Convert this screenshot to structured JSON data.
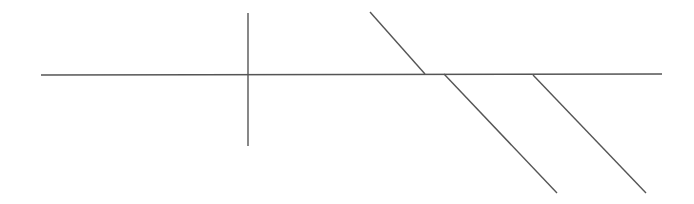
{
  "diagram": {
    "width": 694,
    "height": 204,
    "background": "#ffffff",
    "stroke_color": "#555555",
    "stroke_width": 1.4,
    "lines": [
      {
        "name": "horizontal-line",
        "x1": 41,
        "y1": 75,
        "x2": 662,
        "y2": 74
      },
      {
        "name": "vertical-line",
        "x1": 248,
        "y1": 13,
        "x2": 248,
        "y2": 146
      },
      {
        "name": "diagonal-line-upper",
        "x1": 370,
        "y1": 12,
        "x2": 425,
        "y2": 74
      },
      {
        "name": "diagonal-line-middle",
        "x1": 444,
        "y1": 74,
        "x2": 557,
        "y2": 193
      },
      {
        "name": "diagonal-line-right",
        "x1": 533,
        "y1": 75,
        "x2": 646,
        "y2": 193
      }
    ]
  }
}
